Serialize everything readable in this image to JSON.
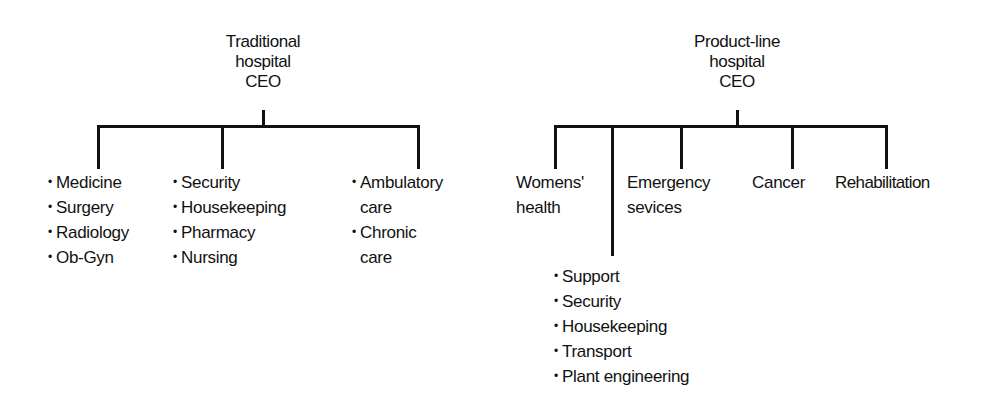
{
  "traditional": {
    "title": [
      "Traditional",
      "hospital",
      "CEO"
    ],
    "groups": [
      {
        "items": [
          "Medicine",
          "Surgery",
          "Radiology",
          "Ob-Gyn"
        ]
      },
      {
        "items": [
          "Security",
          "Housekeeping",
          "Pharmacy",
          "Nursing"
        ]
      },
      {
        "items": [
          {
            "line1": "Ambulatory",
            "line2": "care"
          },
          {
            "line1": "Chronic",
            "line2": "care"
          }
        ]
      }
    ]
  },
  "product_line": {
    "title": [
      "Product-line",
      "hospital",
      "CEO"
    ],
    "units": [
      {
        "line1": "Womens'",
        "line2": "health"
      },
      {
        "line1": "Emergency",
        "line2": "sevices"
      },
      {
        "line1": "Cancer"
      },
      {
        "line1": "Rehabilitation"
      }
    ],
    "support": [
      "Support",
      "Security",
      "Housekeeping",
      "Transport",
      "Plant engineering"
    ]
  },
  "bullet": "•"
}
